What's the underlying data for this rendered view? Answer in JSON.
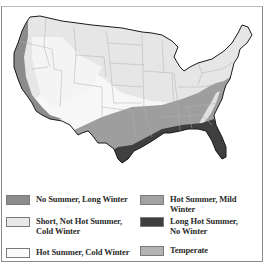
{
  "map": {
    "title": "",
    "region": "Contiguous United States",
    "colors": {
      "no_summer_long_winter": "#8c8c8c",
      "short_not_hot_summer_cold_winter": "#e6e6e6",
      "hot_summer_cold_winter": "#f7f7f7",
      "hot_summer_mild_winter": "#a3a3a3",
      "long_hot_summer_no_winter": "#3f3f3f",
      "temperate": "#b0b0b0",
      "outline": "#1a1a1a",
      "state_lines": "#a8a8a8"
    }
  },
  "legend": {
    "items": [
      {
        "id": "no_summer_long_winter",
        "label_line1": "No Summer, Long Winter",
        "label_line2": "",
        "color": "#8c8c8c"
      },
      {
        "id": "hot_summer_mild_winter",
        "label_line1": "Hot Summer, Mild Winter",
        "label_line2": "",
        "color": "#a3a3a3"
      },
      {
        "id": "short_not_hot_summer_cold_winter",
        "label_line1": "Short, Not Hot Summer,",
        "label_line2": "Cold Winter",
        "color": "#e8e8e8"
      },
      {
        "id": "long_hot_summer_no_winter",
        "label_line1": "Long Hot Summer,",
        "label_line2": "No Winter",
        "color": "#3f3f3f"
      },
      {
        "id": "hot_summer_cold_winter",
        "label_line1": "Hot Summer, Cold Winter",
        "label_line2": "",
        "color": "#fafafa"
      },
      {
        "id": "temperate",
        "label_line1": "Temperate",
        "label_line2": "",
        "color": "#b3b3b3"
      }
    ]
  }
}
